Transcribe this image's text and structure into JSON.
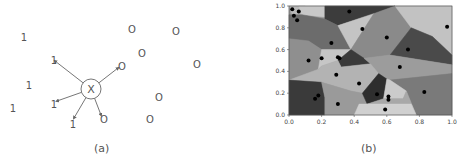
{
  "panel_a": {
    "caption": "(a)",
    "query_label": "X",
    "class_one_label": "1",
    "class_zero_label": "O",
    "query_point": {
      "x": 91,
      "y": 89,
      "r": 10
    },
    "class_one_points": [
      {
        "x": 24,
        "y": 37
      },
      {
        "x": 54,
        "y": 60
      },
      {
        "x": 29,
        "y": 85
      },
      {
        "x": 13,
        "y": 108
      },
      {
        "x": 54,
        "y": 104
      },
      {
        "x": 73,
        "y": 124
      }
    ],
    "class_zero_points": [
      {
        "x": 132,
        "y": 29
      },
      {
        "x": 176,
        "y": 31
      },
      {
        "x": 142,
        "y": 53
      },
      {
        "x": 197,
        "y": 64
      },
      {
        "x": 122,
        "y": 66
      },
      {
        "x": 159,
        "y": 97
      },
      {
        "x": 104,
        "y": 119
      },
      {
        "x": 150,
        "y": 119
      }
    ],
    "neighbor_links": [
      {
        "x": 55,
        "y": 61,
        "to": "1"
      },
      {
        "x": 118,
        "y": 68,
        "to": "O"
      },
      {
        "x": 57,
        "y": 101,
        "to": "1"
      },
      {
        "x": 74,
        "y": 118,
        "to": "1"
      },
      {
        "x": 101,
        "y": 115,
        "to": "O"
      }
    ]
  },
  "panel_b": {
    "caption": "(b)",
    "chart_data": {
      "type": "scatter",
      "title": "",
      "subtitle": "Voronoi tessellation of unit square with generator points",
      "xlabel": "",
      "ylabel": "",
      "xlim": [
        0.0,
        1.0
      ],
      "ylim": [
        0.0,
        1.0
      ],
      "xticks": [
        "0.0",
        "0.2",
        "0.4",
        "0.6",
        "0.8",
        "1.0"
      ],
      "yticks": [
        "0.0",
        "0.2",
        "0.4",
        "0.6",
        "0.8",
        "1.0"
      ],
      "grid": false,
      "legend": null,
      "series": [
        {
          "name": "generators",
          "points": [
            [
              0.02,
              0.97
            ],
            [
              0.03,
              0.91
            ],
            [
              0.06,
              0.95
            ],
            [
              0.05,
              0.87
            ],
            [
              0.37,
              0.95
            ],
            [
              0.45,
              0.79
            ],
            [
              0.6,
              0.71
            ],
            [
              0.73,
              0.6
            ],
            [
              0.97,
              0.81
            ],
            [
              0.26,
              0.66
            ],
            [
              0.12,
              0.5
            ],
            [
              0.2,
              0.52
            ],
            [
              0.3,
              0.53
            ],
            [
              0.31,
              0.52
            ],
            [
              0.68,
              0.44
            ],
            [
              0.29,
              0.37
            ],
            [
              0.43,
              0.29
            ],
            [
              0.83,
              0.21
            ],
            [
              0.18,
              0.18
            ],
            [
              0.16,
              0.15
            ],
            [
              0.3,
              0.1
            ],
            [
              0.54,
              0.19
            ],
            [
              0.61,
              0.17
            ],
            [
              0.61,
              0.14
            ],
            [
              0.59,
              0.05
            ]
          ]
        }
      ]
    },
    "cells": [
      {
        "fill": "#b9b9b9",
        "pts": "0,1 0.02,0.92 0.1,0.9 0.1,1"
      },
      {
        "fill": "#c8c8c8",
        "pts": "0.06,1 0.22,1 0.22,0.9 0.08,0.92"
      },
      {
        "fill": "#3c3c3c",
        "pts": "0.22,1 0.65,1 0.52,0.93 0.3,0.82 0.22,0.88"
      },
      {
        "fill": "#6c6c6c",
        "pts": "0,0.92 0.08,0.92 0.22,0.88 0.3,0.82 0.38,0.6 0.2,0.6 0.12,0.68 0,0.7"
      },
      {
        "fill": "#c4c4c4",
        "pts": "0.3,0.82 0.52,0.93 0.38,0.6"
      },
      {
        "fill": "#8a8a8a",
        "pts": "0.52,0.93 0.65,1 0.75,0.8 0.62,0.55 0.46,0.52 0.38,0.6"
      },
      {
        "fill": "#c2c2c2",
        "pts": "0.65,1 1,1 1,0.55 0.88,0.72 0.75,0.8"
      },
      {
        "fill": "#4a4a4a",
        "pts": "0.75,0.8 0.88,0.72 1,0.55 1,0.46 0.62,0.55"
      },
      {
        "fill": "#8f8f8f",
        "pts": "0,0.7 0.12,0.68 0.2,0.6 0.18,0.42 0,0.32"
      },
      {
        "fill": "#c6c6c6",
        "pts": "0.2,0.6 0.38,0.6 0.3,0.5 0.2,0.45 0.18,0.42"
      },
      {
        "fill": "#3a3a3a",
        "pts": "0.38,0.6 0.46,0.52 0.5,0.47 0.32,0.44 0.3,0.5"
      },
      {
        "fill": "#9c9c9c",
        "pts": "0.46,0.52 0.62,0.55 1,0.46 1,0.38 0.62,0.32 0.55,0.38 0.5,0.47"
      },
      {
        "fill": "#b3b3b3",
        "pts": "0.18,0.42 0.2,0.45 0.3,0.5 0.32,0.44 0.5,0.47 0.55,0.38 0.45,0.2 0.38,0.22 0.2,0.3 0,0.32"
      },
      {
        "fill": "#7a7a7a",
        "pts": "0.62,0.32 1,0.38 1,0 0.78,0 0.72,0.22"
      },
      {
        "fill": "#3a3a3a",
        "pts": "0,0.32 0.2,0.3 0.22,0.16 0.22,0 0,0"
      },
      {
        "fill": "#9a9a9a",
        "pts": "0.2,0.3 0.38,0.22 0.45,0.2 0.43,0.1 0.4,0 0.22,0 0.22,0.16"
      },
      {
        "fill": "#2e2e2e",
        "pts": "0.45,0.2 0.55,0.38 0.6,0.33 0.58,0.15 0.48,0.1"
      },
      {
        "fill": "#cbcbcb",
        "pts": "0.6,0.33 0.62,0.32 0.72,0.22 0.7,0.15 0.58,0.15"
      },
      {
        "fill": "#a8a8a8",
        "pts": "0.58,0.15 0.7,0.15 0.72,0.22 0.78,0 0.75,0.1 0.48,0.1"
      },
      {
        "fill": "#d0d0d0",
        "pts": "0.43,0.1 0.48,0.1 0.75,0.1 0.78,0 0.4,0"
      }
    ]
  }
}
